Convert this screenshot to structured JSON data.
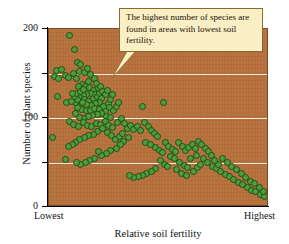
{
  "chart_data": {
    "type": "scatter",
    "title": "",
    "xlabel": "Relative soil fertility",
    "ylabel": "Number of plant species",
    "xtick_labels": [
      "Lowest",
      "Highest"
    ],
    "ytick_labels": [
      "0",
      "100",
      "200"
    ],
    "ytick_values": [
      0,
      50,
      100,
      150,
      200
    ],
    "ylim": [
      0,
      200
    ],
    "xlim": [
      0,
      100
    ],
    "grid": "horizontal white gridlines at 50, 100, 150",
    "legend": "none",
    "annotation": "The highest number of species are found in areas with lowest soil fertility.",
    "marker_fill": "#4f9c3a",
    "marker_edge": "#1f4d18",
    "plot_background": "#b5703c",
    "points": [
      [
        9.5,
        193
      ],
      [
        11.5,
        177
      ],
      [
        13.0,
        162
      ],
      [
        14.5,
        160
      ],
      [
        3.5,
        153
      ],
      [
        5.5,
        155
      ],
      [
        7.5,
        148
      ],
      [
        11.0,
        150
      ],
      [
        14.0,
        152
      ],
      [
        16.0,
        151
      ],
      [
        2.5,
        147
      ],
      [
        4.5,
        145
      ],
      [
        9.0,
        146
      ],
      [
        12.5,
        144
      ],
      [
        17.5,
        156
      ],
      [
        19.0,
        149
      ],
      [
        20.5,
        145
      ],
      [
        18.0,
        141
      ],
      [
        15.0,
        138
      ],
      [
        13.5,
        135
      ],
      [
        4.0,
        124
      ],
      [
        8.0,
        118
      ],
      [
        16.5,
        136
      ],
      [
        18.5,
        134
      ],
      [
        20.0,
        131
      ],
      [
        21.5,
        139
      ],
      [
        22.5,
        133
      ],
      [
        23.5,
        136
      ],
      [
        19.5,
        128
      ],
      [
        17.0,
        127
      ],
      [
        15.5,
        125
      ],
      [
        14.0,
        123
      ],
      [
        16.0,
        121
      ],
      [
        18.0,
        119
      ],
      [
        20.0,
        122
      ],
      [
        21.0,
        126
      ],
      [
        22.0,
        124
      ],
      [
        23.0,
        128
      ],
      [
        24.5,
        130
      ],
      [
        25.5,
        127
      ],
      [
        26.5,
        131
      ],
      [
        24.0,
        122
      ],
      [
        22.8,
        118
      ],
      [
        21.2,
        116
      ],
      [
        19.2,
        114
      ],
      [
        17.2,
        115
      ],
      [
        15.2,
        117
      ],
      [
        13.2,
        113
      ],
      [
        14.8,
        110
      ],
      [
        16.8,
        108
      ],
      [
        18.8,
        109
      ],
      [
        20.8,
        111
      ],
      [
        22.8,
        110
      ],
      [
        24.8,
        113
      ],
      [
        26.8,
        116
      ],
      [
        28.0,
        121
      ],
      [
        28.8,
        127
      ],
      [
        27.5,
        112
      ],
      [
        25.8,
        107
      ],
      [
        23.8,
        105
      ],
      [
        21.8,
        104
      ],
      [
        19.8,
        103
      ],
      [
        17.8,
        102
      ],
      [
        15.8,
        100
      ],
      [
        13.8,
        101
      ],
      [
        12.2,
        105
      ],
      [
        12.8,
        112
      ],
      [
        11.8,
        118
      ],
      [
        13.0,
        121
      ],
      [
        11.5,
        124
      ],
      [
        12.5,
        128
      ],
      [
        14.2,
        130
      ],
      [
        15.8,
        132
      ],
      [
        10.5,
        128
      ],
      [
        10.0,
        119
      ],
      [
        26.0,
        102
      ],
      [
        27.8,
        101
      ],
      [
        29.2,
        108
      ],
      [
        30.5,
        113
      ],
      [
        31.5,
        118
      ],
      [
        1.5,
        78
      ],
      [
        9.5,
        96
      ],
      [
        11.0,
        93
      ],
      [
        13.5,
        91
      ],
      [
        15.5,
        95
      ],
      [
        17.5,
        92
      ],
      [
        19.5,
        90
      ],
      [
        21.5,
        94
      ],
      [
        23.5,
        93
      ],
      [
        25.5,
        96
      ],
      [
        27.0,
        92
      ],
      [
        29.0,
        89
      ],
      [
        31.0,
        95
      ],
      [
        33.0,
        99
      ],
      [
        34.5,
        94
      ],
      [
        24.5,
        88
      ],
      [
        22.0,
        85
      ],
      [
        20.0,
        82
      ],
      [
        18.0,
        80
      ],
      [
        16.0,
        78
      ],
      [
        14.0,
        76
      ],
      [
        12.0,
        73
      ],
      [
        10.5,
        70
      ],
      [
        9.0,
        68
      ],
      [
        7.5,
        53
      ],
      [
        26.5,
        84
      ],
      [
        28.5,
        80
      ],
      [
        30.0,
        76
      ],
      [
        32.0,
        79
      ],
      [
        33.5,
        83
      ],
      [
        35.5,
        88
      ],
      [
        37.0,
        92
      ],
      [
        38.5,
        87
      ],
      [
        40.0,
        91
      ],
      [
        41.5,
        86
      ],
      [
        36.0,
        78
      ],
      [
        34.0,
        74
      ],
      [
        32.5,
        70
      ],
      [
        30.5,
        66
      ],
      [
        28.0,
        63
      ],
      [
        26.0,
        60
      ],
      [
        24.0,
        58
      ],
      [
        22.5,
        62
      ],
      [
        20.5,
        55
      ],
      [
        18.5,
        52
      ],
      [
        16.5,
        50
      ],
      [
        14.5,
        48
      ],
      [
        12.5,
        50
      ],
      [
        42.5,
        113
      ],
      [
        52.0,
        117
      ],
      [
        43.5,
        95
      ],
      [
        45.0,
        90
      ],
      [
        46.5,
        86
      ],
      [
        48.0,
        83
      ],
      [
        49.5,
        79
      ],
      [
        44.0,
        73
      ],
      [
        46.0,
        70
      ],
      [
        48.5,
        67
      ],
      [
        50.0,
        64
      ],
      [
        51.5,
        61
      ],
      [
        53.0,
        72
      ],
      [
        54.5,
        68
      ],
      [
        56.0,
        65
      ],
      [
        57.5,
        62
      ],
      [
        59.0,
        72
      ],
      [
        60.5,
        68
      ],
      [
        62.0,
        64
      ],
      [
        63.5,
        67
      ],
      [
        65.0,
        70
      ],
      [
        66.5,
        66
      ],
      [
        55.0,
        57
      ],
      [
        57.0,
        54
      ],
      [
        59.5,
        50
      ],
      [
        61.5,
        47
      ],
      [
        63.0,
        44
      ],
      [
        50.5,
        52
      ],
      [
        52.5,
        48
      ],
      [
        54.0,
        45
      ],
      [
        48.5,
        43
      ],
      [
        46.5,
        40
      ],
      [
        44.5,
        38
      ],
      [
        42.5,
        36
      ],
      [
        40.5,
        34
      ],
      [
        38.5,
        33
      ],
      [
        36.5,
        35
      ],
      [
        68.0,
        74
      ],
      [
        69.5,
        70
      ],
      [
        71.0,
        66
      ],
      [
        72.5,
        62
      ],
      [
        74.0,
        58
      ],
      [
        70.0,
        55
      ],
      [
        72.0,
        50
      ],
      [
        74.5,
        46
      ],
      [
        76.0,
        43
      ],
      [
        78.0,
        40
      ],
      [
        80.0,
        37
      ],
      [
        82.0,
        34
      ],
      [
        84.0,
        31
      ],
      [
        86.0,
        28
      ],
      [
        88.0,
        25
      ],
      [
        90.0,
        22
      ],
      [
        92.0,
        19
      ],
      [
        94.0,
        17
      ],
      [
        96.0,
        14
      ],
      [
        98.0,
        12
      ],
      [
        85.0,
        42
      ],
      [
        87.5,
        38
      ],
      [
        89.5,
        33
      ],
      [
        91.5,
        29
      ],
      [
        93.5,
        26
      ],
      [
        95.5,
        22
      ],
      [
        97.5,
        18
      ],
      [
        83.0,
        46
      ],
      [
        81.0,
        50
      ],
      [
        79.0,
        54
      ],
      [
        77.0,
        48
      ],
      [
        75.0,
        52
      ],
      [
        67.0,
        58
      ],
      [
        64.5,
        55
      ],
      [
        58.0,
        42
      ],
      [
        60.0,
        38
      ],
      [
        62.5,
        35
      ],
      [
        65.5,
        40
      ],
      [
        67.5,
        44
      ],
      [
        69.0,
        48
      ]
    ]
  },
  "axes": {
    "y_title": "Number of plant species",
    "x_title": "Relative soil fertility",
    "y_labels": [
      "200",
      "100",
      "0"
    ],
    "x_label_low": "Lowest",
    "x_label_high": "Highest"
  },
  "callout": {
    "text": "The highest number of species are found in areas with lowest soil fertility."
  }
}
